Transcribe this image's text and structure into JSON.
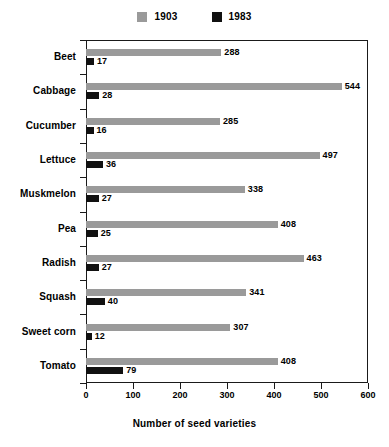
{
  "chart_data": {
    "type": "bar",
    "orientation": "horizontal",
    "title": "",
    "xlabel": "Number of seed varieties",
    "ylabel": "",
    "xlim": [
      0,
      600
    ],
    "xticks": [
      0,
      100,
      200,
      300,
      400,
      500,
      600
    ],
    "grid": false,
    "legend_position": "top-center",
    "categories": [
      "Beet",
      "Cabbage",
      "Cucumber",
      "Lettuce",
      "Muskmelon",
      "Pea",
      "Radish",
      "Squash",
      "Sweet corn",
      "Tomato"
    ],
    "series": [
      {
        "name": "1903",
        "color": "#9a9a9a",
        "values": [
          288,
          544,
          285,
          497,
          338,
          408,
          463,
          341,
          307,
          408
        ]
      },
      {
        "name": "1983",
        "color": "#111111",
        "values": [
          17,
          28,
          16,
          36,
          27,
          25,
          27,
          40,
          12,
          79
        ]
      }
    ]
  },
  "legend": {
    "entries": [
      {
        "label": "1903",
        "color": "#9a9a9a"
      },
      {
        "label": "1983",
        "color": "#111111"
      }
    ]
  },
  "axis": {
    "x_title": "Number of seed varieties",
    "x_tick_labels": [
      "0",
      "100",
      "200",
      "300",
      "400",
      "500",
      "600"
    ]
  }
}
